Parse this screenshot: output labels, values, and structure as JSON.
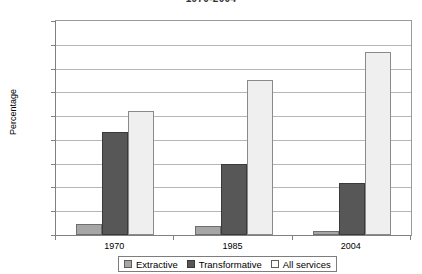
{
  "chart_data": {
    "type": "bar",
    "title": "1970-2004",
    "xlabel": "",
    "ylabel": "Percentage",
    "categories": [
      "1970",
      "1985",
      "2004"
    ],
    "series": [
      {
        "name": "Extractive",
        "color": "#a6a6a6",
        "values": [
          4.5,
          3.8,
          1.5
        ]
      },
      {
        "name": "Transformative",
        "color": "#575757",
        "values": [
          43.5,
          30.0,
          22.0
        ]
      },
      {
        "name": "All services",
        "color": "#efefef",
        "values": [
          52.0,
          65.0,
          77.0
        ]
      }
    ],
    "ylim": [
      0,
      90
    ],
    "yticks": [
      0,
      10,
      20,
      30,
      40,
      50,
      60,
      70,
      80,
      90
    ],
    "ytick_labels": [
      "0",
      "10",
      "20",
      "30",
      "40",
      "50",
      "60",
      "70",
      "80",
      "90"
    ],
    "grid": true,
    "legend_position": "bottom"
  }
}
